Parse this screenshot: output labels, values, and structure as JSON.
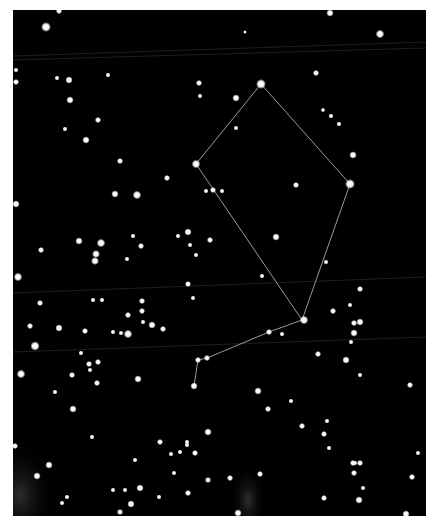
{
  "map": {
    "frame": {
      "x": 13,
      "y": 10,
      "width": 413,
      "height": 506
    },
    "colors": {
      "sky": "#000000",
      "border": "#ffffff",
      "star": "#ffffff",
      "constellation_line": "#9a9a9a",
      "grid_line": "#262626",
      "glow": "#3a3a3a"
    },
    "grid_lines": [
      {
        "x1": 13,
        "y1": 56,
        "x2": 426,
        "y2": 42
      },
      {
        "x1": 13,
        "y1": 60,
        "x2": 426,
        "y2": 48
      },
      {
        "x1": 13,
        "y1": 293,
        "x2": 426,
        "y2": 277
      },
      {
        "x1": 13,
        "y1": 352,
        "x2": 426,
        "y2": 337
      }
    ],
    "glows": [
      {
        "cx": 20,
        "cy": 495,
        "rx": 35,
        "ry": 55
      },
      {
        "cx": 248,
        "cy": 500,
        "rx": 18,
        "ry": 35
      }
    ],
    "constellation": {
      "segments": [
        [
          [
            261,
            84
          ],
          [
            196,
            164
          ]
        ],
        [
          [
            261,
            84
          ],
          [
            350,
            184
          ]
        ],
        [
          [
            196,
            164
          ],
          [
            302,
            320
          ]
        ],
        [
          [
            350,
            184
          ],
          [
            302,
            320
          ]
        ],
        [
          [
            302,
            320
          ],
          [
            269,
            332
          ]
        ],
        [
          [
            269,
            332
          ],
          [
            207,
            358
          ]
        ],
        [
          [
            207,
            358
          ],
          [
            198,
            360
          ]
        ],
        [
          [
            198,
            360
          ],
          [
            194,
            386
          ]
        ]
      ]
    },
    "stars": [
      [
        59,
        11,
        2.5
      ],
      [
        46,
        27,
        4
      ],
      [
        245,
        32,
        1.5
      ],
      [
        330,
        13,
        3
      ],
      [
        380,
        34,
        3.5
      ],
      [
        16,
        70,
        2
      ],
      [
        16,
        82,
        2.5
      ],
      [
        57,
        78,
        2
      ],
      [
        69,
        80,
        3
      ],
      [
        108,
        75,
        2
      ],
      [
        199,
        83,
        2.5
      ],
      [
        200,
        96,
        2
      ],
      [
        236,
        98,
        3
      ],
      [
        316,
        73,
        2.5
      ],
      [
        261,
        84,
        4
      ],
      [
        70,
        100,
        3
      ],
      [
        98,
        120,
        2.5
      ],
      [
        236,
        128,
        2
      ],
      [
        323,
        110,
        1.8
      ],
      [
        331,
        116,
        2
      ],
      [
        339,
        124,
        2
      ],
      [
        65,
        129,
        2
      ],
      [
        86,
        140,
        3
      ],
      [
        353,
        155,
        3
      ],
      [
        120,
        161,
        2.5
      ],
      [
        167,
        178,
        2.5
      ],
      [
        196,
        164,
        3.5
      ],
      [
        350,
        184,
        4
      ],
      [
        137,
        195,
        3.5
      ],
      [
        115,
        194,
        3
      ],
      [
        206,
        191,
        2
      ],
      [
        213,
        190,
        2.5
      ],
      [
        222,
        191,
        2
      ],
      [
        296,
        185,
        2.5
      ],
      [
        16,
        204,
        3
      ],
      [
        41,
        250,
        2.5
      ],
      [
        79,
        241,
        3
      ],
      [
        101,
        243,
        3.5
      ],
      [
        96,
        254,
        3.2
      ],
      [
        95,
        261,
        3.2
      ],
      [
        133,
        236,
        2
      ],
      [
        127,
        259,
        2
      ],
      [
        141,
        246,
        2.5
      ],
      [
        178,
        236,
        2
      ],
      [
        188,
        232,
        3
      ],
      [
        190,
        245,
        2
      ],
      [
        210,
        240,
        2.5
      ],
      [
        276,
        237,
        3
      ],
      [
        196,
        255,
        2
      ],
      [
        262,
        276,
        2
      ],
      [
        18,
        277,
        3.5
      ],
      [
        40,
        303,
        2.5
      ],
      [
        93,
        300,
        2
      ],
      [
        102,
        300,
        2
      ],
      [
        142,
        301,
        2.5
      ],
      [
        142,
        311,
        2.5
      ],
      [
        128,
        315,
        2.5
      ],
      [
        143,
        322,
        2
      ],
      [
        152,
        325,
        3
      ],
      [
        163,
        329,
        2.5
      ],
      [
        59,
        328,
        3
      ],
      [
        121,
        333,
        2
      ],
      [
        128,
        334,
        3.5
      ],
      [
        30,
        326,
        2.5
      ],
      [
        113,
        332,
        2
      ],
      [
        188,
        284,
        2.5
      ],
      [
        193,
        298,
        2
      ],
      [
        326,
        262,
        2
      ],
      [
        304,
        320,
        3.5
      ],
      [
        269,
        332,
        2.5
      ],
      [
        282,
        334,
        2
      ],
      [
        360,
        289,
        2.5
      ],
      [
        333,
        311,
        2.5
      ],
      [
        350,
        305,
        2
      ],
      [
        354,
        323,
        2.5
      ],
      [
        360,
        322,
        3
      ],
      [
        354,
        333,
        3
      ],
      [
        351,
        342,
        2
      ],
      [
        35,
        346,
        3.8
      ],
      [
        85,
        331,
        2.5
      ],
      [
        81,
        353,
        2
      ],
      [
        98,
        362,
        2.5
      ],
      [
        207,
        358,
        2.5
      ],
      [
        198,
        360,
        2.5
      ],
      [
        318,
        354,
        2.5
      ],
      [
        346,
        360,
        3
      ],
      [
        194,
        386,
        3
      ],
      [
        21,
        374,
        3.5
      ],
      [
        89,
        364,
        2.5
      ],
      [
        90,
        370,
        2
      ],
      [
        72,
        375,
        2.5
      ],
      [
        97,
        383,
        2.5
      ],
      [
        138,
        379,
        3
      ],
      [
        55,
        392,
        2
      ],
      [
        73,
        409,
        3
      ],
      [
        258,
        391,
        3
      ],
      [
        268,
        409,
        2.5
      ],
      [
        291,
        401,
        2
      ],
      [
        302,
        426,
        2.5
      ],
      [
        327,
        421,
        2
      ],
      [
        324,
        434,
        2.5
      ],
      [
        410,
        385,
        2.5
      ],
      [
        360,
        375,
        2
      ],
      [
        92,
        437,
        2
      ],
      [
        160,
        442,
        2.5
      ],
      [
        187,
        442,
        2
      ],
      [
        180,
        452,
        2
      ],
      [
        171,
        454,
        2
      ],
      [
        15,
        446,
        2.5
      ],
      [
        49,
        465,
        3
      ],
      [
        37,
        476,
        3
      ],
      [
        67,
        497,
        2
      ],
      [
        62,
        503,
        2
      ],
      [
        135,
        460,
        2
      ],
      [
        140,
        488,
        3
      ],
      [
        113,
        490,
        2
      ],
      [
        125,
        490,
        2
      ],
      [
        131,
        504,
        3
      ],
      [
        159,
        497,
        2
      ],
      [
        120,
        512,
        2.5
      ],
      [
        174,
        473,
        2
      ],
      [
        208,
        432,
        3
      ],
      [
        195,
        453,
        2.5
      ],
      [
        187,
        445,
        2
      ],
      [
        238,
        513,
        3
      ],
      [
        260,
        474,
        2.5
      ],
      [
        188,
        493,
        2.5
      ],
      [
        355,
        463,
        2
      ],
      [
        354,
        473,
        2.5
      ],
      [
        353,
        463,
        2.5
      ],
      [
        360,
        463,
        2.5
      ],
      [
        363,
        488,
        2
      ],
      [
        324,
        498,
        2.5
      ],
      [
        359,
        500,
        3
      ],
      [
        412,
        477,
        2.5
      ],
      [
        418,
        453,
        2
      ],
      [
        230,
        478,
        2.5
      ],
      [
        208,
        480,
        2.5
      ],
      [
        406,
        514,
        3
      ],
      [
        329,
        448,
        2
      ]
    ]
  }
}
